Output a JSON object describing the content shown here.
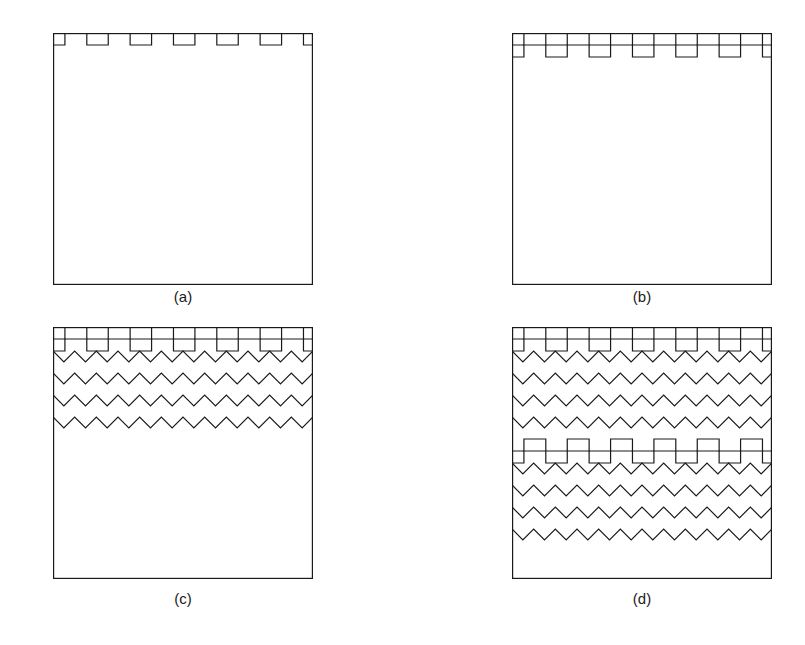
{
  "figure": {
    "title": "",
    "background_color": "#ffffff",
    "stroke_color": "#1a1a1a",
    "stroke_width": 1.2,
    "panel_width": 260,
    "panel_height": 252,
    "panels": [
      {
        "id": "a",
        "label": "(a)",
        "x": 53,
        "y": 33,
        "rows": [
          {
            "type": "square",
            "periods": 6,
            "amplitude": 12,
            "row_height": 12
          }
        ]
      },
      {
        "id": "b",
        "label": "(b)",
        "x": 512,
        "y": 33,
        "rows": [
          {
            "type": "square",
            "periods": 6,
            "amplitude": 12,
            "row_height": 12
          },
          {
            "type": "square",
            "periods": 6,
            "amplitude": 12,
            "row_height": 12
          }
        ]
      },
      {
        "id": "c",
        "label": "(c)",
        "x": 53,
        "y": 327,
        "rows": [
          {
            "type": "square",
            "periods": 6,
            "amplitude": 12,
            "row_height": 12
          },
          {
            "type": "square",
            "periods": 6,
            "amplitude": 12,
            "row_height": 12
          },
          {
            "type": "zigzag",
            "periods": 12,
            "amplitude": 11,
            "row_height": 22
          },
          {
            "type": "zigzag",
            "periods": 12,
            "amplitude": 11,
            "row_height": 22
          },
          {
            "type": "zigzag",
            "periods": 12,
            "amplitude": 11,
            "row_height": 22
          },
          {
            "type": "zigzag",
            "periods": 12,
            "amplitude": 11,
            "row_height": 22
          }
        ]
      },
      {
        "id": "d",
        "label": "(d)",
        "x": 512,
        "y": 327,
        "rows": [
          {
            "type": "square",
            "periods": 6,
            "amplitude": 12,
            "row_height": 12
          },
          {
            "type": "square",
            "periods": 6,
            "amplitude": 12,
            "row_height": 12
          },
          {
            "type": "zigzag",
            "periods": 12,
            "amplitude": 11,
            "row_height": 22
          },
          {
            "type": "zigzag",
            "periods": 12,
            "amplitude": 11,
            "row_height": 22
          },
          {
            "type": "zigzag",
            "periods": 12,
            "amplitude": 11,
            "row_height": 22
          },
          {
            "type": "zigzag",
            "periods": 12,
            "amplitude": 11,
            "row_height": 22
          },
          {
            "type": "square",
            "periods": 6,
            "amplitude": 12,
            "row_height": 12
          },
          {
            "type": "square",
            "periods": 6,
            "amplitude": 12,
            "row_height": 12
          },
          {
            "type": "zigzag",
            "periods": 12,
            "amplitude": 11,
            "row_height": 22
          },
          {
            "type": "zigzag",
            "periods": 12,
            "amplitude": 11,
            "row_height": 22
          },
          {
            "type": "zigzag",
            "periods": 12,
            "amplitude": 11,
            "row_height": 22
          },
          {
            "type": "zigzag",
            "periods": 12,
            "amplitude": 11,
            "row_height": 22
          }
        ]
      }
    ]
  }
}
